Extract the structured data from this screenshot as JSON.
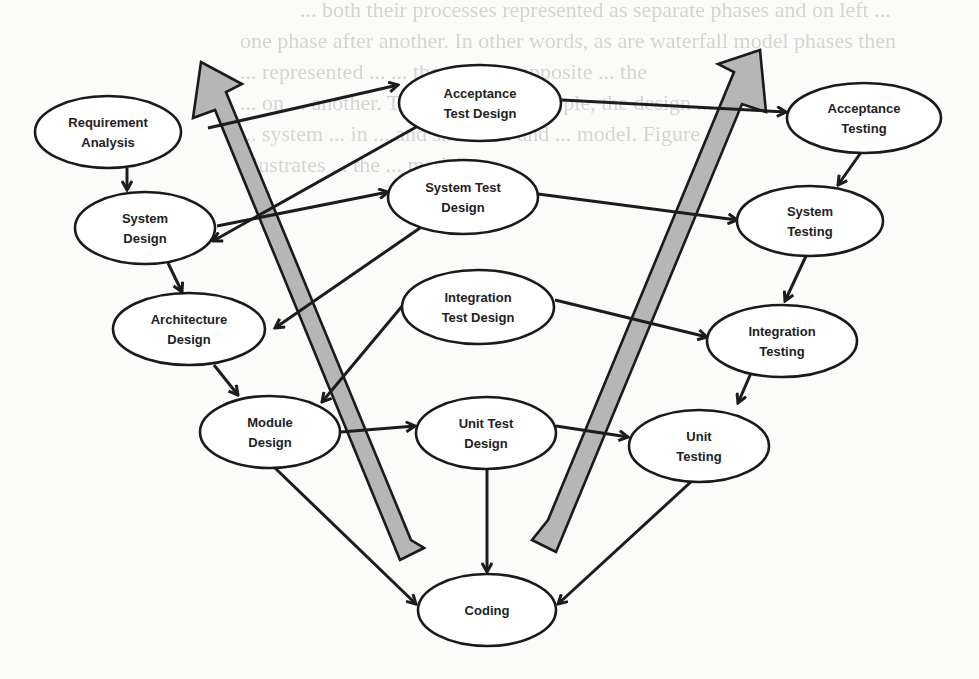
{
  "diagram": {
    "colors": {
      "node_fill": "#ffffff",
      "node_stroke": "#1a1a1a",
      "edge": "#1c1c1c",
      "big_arrow_fill": "#b6b6b6",
      "background": "#fbfbfa",
      "background_text": "#d4d4d2"
    },
    "background_text_lines": [
      "... both their processes represented as separate phases and on left ...",
      "one phase after another. In other words, as are waterfall model phases then",
      "... represented ... ... the same ... opposite ... the",
      "... on ... another. Therefore, for example, the design ...",
      "... system ... in ... and shown ... and ... model. Figure 1",
      "illustrates ... the ... model."
    ],
    "nodes": [
      {
        "id": "req",
        "lines": [
          "Requirement",
          "Analysis"
        ],
        "cx": 108,
        "cy": 132,
        "rx": 73,
        "ry": 36
      },
      {
        "id": "sysd",
        "lines": [
          "System",
          "Design"
        ],
        "cx": 145,
        "cy": 228,
        "rx": 70,
        "ry": 36
      },
      {
        "id": "arch",
        "lines": [
          "Architecture",
          "Design"
        ],
        "cx": 189,
        "cy": 329,
        "rx": 76,
        "ry": 36
      },
      {
        "id": "mod",
        "lines": [
          "Module",
          "Design"
        ],
        "cx": 270,
        "cy": 432,
        "rx": 70,
        "ry": 36
      },
      {
        "id": "atd",
        "lines": [
          "Acceptance",
          "Test Design"
        ],
        "cx": 480,
        "cy": 103,
        "rx": 81,
        "ry": 38
      },
      {
        "id": "std",
        "lines": [
          "System Test",
          "Design"
        ],
        "cx": 463,
        "cy": 197,
        "rx": 75,
        "ry": 37
      },
      {
        "id": "itd",
        "lines": [
          "Integration",
          "Test Design"
        ],
        "cx": 478,
        "cy": 307,
        "rx": 76,
        "ry": 37
      },
      {
        "id": "utd",
        "lines": [
          "Unit Test",
          "Design"
        ],
        "cx": 486,
        "cy": 433,
        "rx": 70,
        "ry": 36
      },
      {
        "id": "at",
        "lines": [
          "Acceptance",
          "Testing"
        ],
        "cx": 864,
        "cy": 118,
        "rx": 77,
        "ry": 35
      },
      {
        "id": "st",
        "lines": [
          "System",
          "Testing"
        ],
        "cx": 810,
        "cy": 221,
        "rx": 73,
        "ry": 35
      },
      {
        "id": "it",
        "lines": [
          "Integration",
          "Testing"
        ],
        "cx": 782,
        "cy": 341,
        "rx": 75,
        "ry": 36
      },
      {
        "id": "ut",
        "lines": [
          "Unit",
          "Testing"
        ],
        "cx": 699,
        "cy": 446,
        "rx": 70,
        "ry": 36
      },
      {
        "id": "code",
        "lines": [
          "Coding"
        ],
        "cx": 487,
        "cy": 610,
        "rx": 69,
        "ry": 36
      }
    ],
    "edges": [
      {
        "from": "req",
        "to": "sysd",
        "x1": 127,
        "y1": 168,
        "x2": 127,
        "y2": 190
      },
      {
        "from": "sysd",
        "to": "arch",
        "x1": 168,
        "y1": 263,
        "x2": 182,
        "y2": 292
      },
      {
        "from": "arch",
        "to": "mod",
        "x1": 214,
        "y1": 365,
        "x2": 238,
        "y2": 395
      },
      {
        "from": "req",
        "to": "atd",
        "x1": 208,
        "y1": 128,
        "x2": 398,
        "y2": 85
      },
      {
        "from": "atd",
        "to": "sysd",
        "x1": 418,
        "y1": 126,
        "x2": 213,
        "y2": 241
      },
      {
        "from": "sysd",
        "to": "std",
        "x1": 217,
        "y1": 226,
        "x2": 388,
        "y2": 192
      },
      {
        "from": "std",
        "to": "arch",
        "x1": 420,
        "y1": 228,
        "x2": 275,
        "y2": 328
      },
      {
        "from": "itd",
        "to": "mod",
        "x1": 403,
        "y1": 305,
        "x2": 322,
        "y2": 402
      },
      {
        "from": "mod",
        "to": "utd",
        "x1": 341,
        "y1": 432,
        "x2": 415,
        "y2": 426
      },
      {
        "from": "atd",
        "to": "at",
        "x1": 562,
        "y1": 100,
        "x2": 786,
        "y2": 112
      },
      {
        "from": "std",
        "to": "st",
        "x1": 538,
        "y1": 194,
        "x2": 737,
        "y2": 220
      },
      {
        "from": "itd",
        "to": "it",
        "x1": 555,
        "y1": 300,
        "x2": 707,
        "y2": 337
      },
      {
        "from": "utd",
        "to": "ut",
        "x1": 556,
        "y1": 426,
        "x2": 628,
        "y2": 437
      },
      {
        "from": "at",
        "to": "st",
        "x1": 862,
        "y1": 151,
        "x2": 838,
        "y2": 185
      },
      {
        "from": "st",
        "to": "it",
        "x1": 806,
        "y1": 256,
        "x2": 785,
        "y2": 301
      },
      {
        "from": "it",
        "to": "ut",
        "x1": 751,
        "y1": 373,
        "x2": 738,
        "y2": 403
      },
      {
        "from": "mod",
        "to": "code",
        "x1": 275,
        "y1": 468,
        "x2": 416,
        "y2": 604
      },
      {
        "from": "utd",
        "to": "code",
        "x1": 487,
        "y1": 470,
        "x2": 487,
        "y2": 572
      },
      {
        "from": "ut",
        "to": "code",
        "x1": 693,
        "y1": 480,
        "x2": 558,
        "y2": 604
      }
    ],
    "big_arrows": [
      {
        "id": "left-up-arrow",
        "direction": "up-left",
        "points": "424,548 400,560 215,110 193,118 201,62 242,84 226,92 411,540"
      },
      {
        "id": "right-up-arrow",
        "direction": "up-right",
        "points": "532,540 556,552 742,104 766,112 760,50 718,64 734,72 548,520"
      }
    ]
  }
}
